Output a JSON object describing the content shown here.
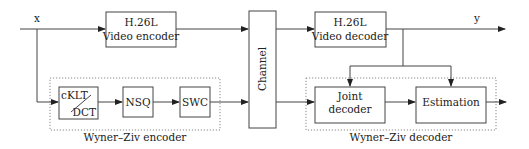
{
  "diagram": {
    "signals": {
      "input": "x",
      "output": "y"
    },
    "blocks": {
      "video_encoder": {
        "line1": "H.26L",
        "line2": "Video encoder"
      },
      "channel": "Channel",
      "video_decoder": {
        "line1": "H.26L",
        "line2": "Video decoder"
      },
      "transform": {
        "top": "cKLT",
        "bottom": "DCT"
      },
      "nsq": "NSQ",
      "swc": "SWC",
      "joint_decoder": {
        "line1": "Joint",
        "line2": "decoder"
      },
      "estimation": "Estimation"
    },
    "groups": {
      "encoder": "Wyner–Ziv encoder",
      "decoder": "Wyner–Ziv decoder"
    },
    "colors": {
      "stroke": "#444444",
      "dotted": "#888888",
      "text": "#222222"
    }
  }
}
